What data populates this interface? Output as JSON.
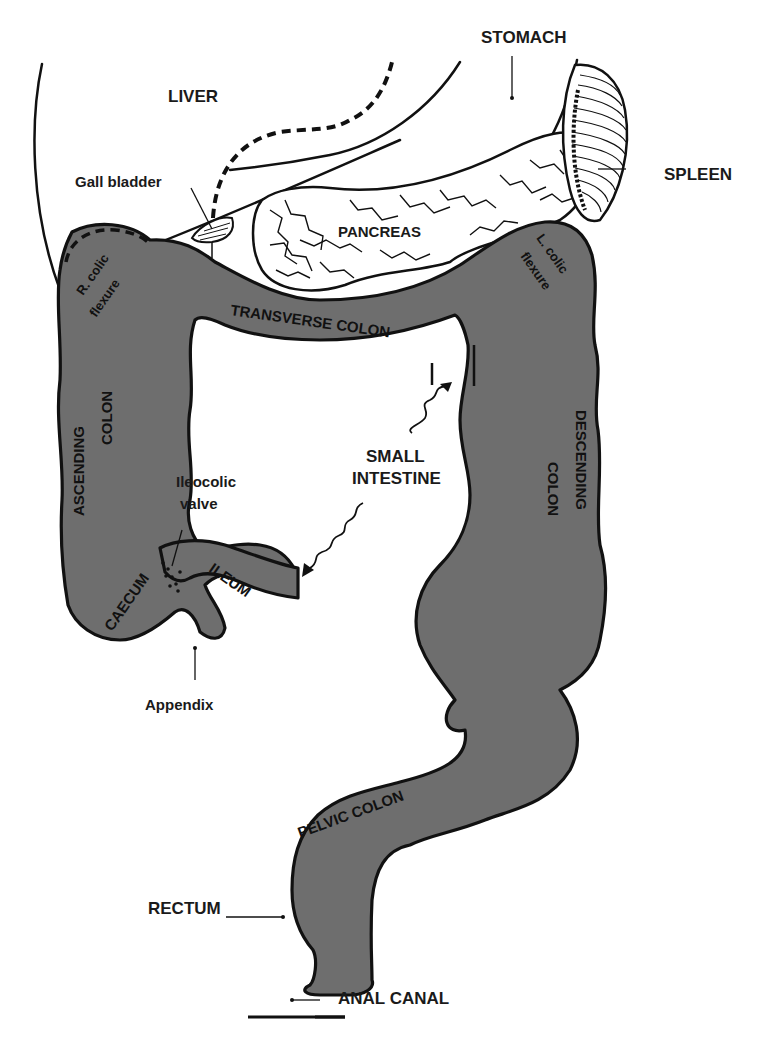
{
  "diagram": {
    "colors": {
      "gut_fill": "#6e6e6e",
      "outline": "#111111",
      "background": "#ffffff"
    },
    "labels": {
      "stomach": "STOMACH",
      "liver": "LIVER",
      "spleen": "SPLEEN",
      "gall_bladder": "Gall bladder",
      "pancreas": "PANCREAS",
      "r_colic_flexure_1": "R. colic",
      "r_colic_flexure_2": "flexure",
      "l_colic_flexure_1": "L. colic",
      "l_colic_flexure_2": "flexure",
      "transverse_colon": "TRANSVERSE COLON",
      "ascending_colon_1": "ASCENDING",
      "ascending_colon_2": "COLON",
      "descending_colon_1": "DESCENDING",
      "descending_colon_2": "COLON",
      "small_intestine_1": "SMALL",
      "small_intestine_2": "INTESTINE",
      "ileocolic_valve_1": "Ileocolic",
      "ileocolic_valve_2": "valve",
      "ileum": "ILEUM",
      "caecum": "CAECUM",
      "appendix": "Appendix",
      "pelvic_colon": "PELVIC COLON",
      "rectum": "RECTUM",
      "anal_canal": "ANAL CANAL"
    }
  }
}
